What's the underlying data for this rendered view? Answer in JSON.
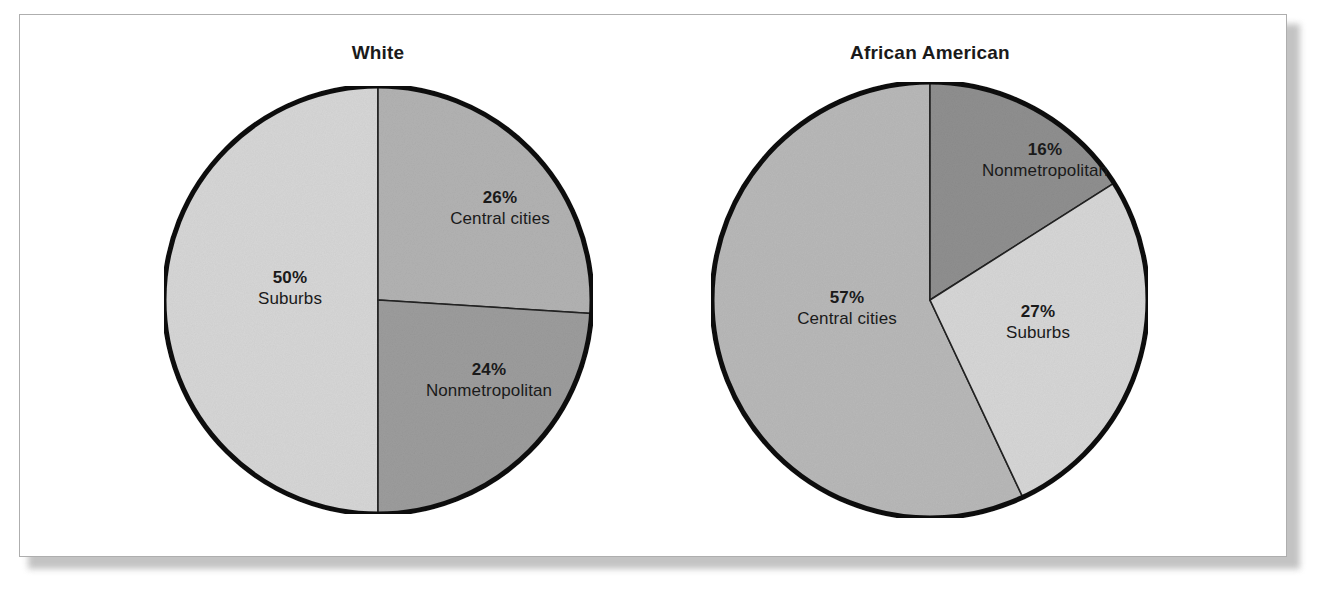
{
  "figure": {
    "background_color": "#ffffff",
    "frame_border_color": "#aeaeae"
  },
  "chart_data": [
    {
      "type": "pie",
      "title": "White",
      "categories": [
        "Central cities",
        "Nonmetropolitan",
        "Suburbs"
      ],
      "values": [
        26,
        24,
        50
      ],
      "labels": [
        "26%",
        "24%",
        "50%"
      ],
      "unit": "percent",
      "legend": "none",
      "slice_colors": [
        "#b2b2b2",
        "#9c9c9c",
        "#d6d6d6"
      ],
      "slices": [
        {
          "label": "Central cities",
          "value": 26,
          "value_label": "26%",
          "color": "#b2b2b2",
          "start_deg": 0,
          "end_deg": 93.6
        },
        {
          "label": "Nonmetropolitan",
          "value": 24,
          "value_label": "24%",
          "color": "#9c9c9c",
          "start_deg": 93.6,
          "end_deg": 180
        },
        {
          "label": "Suburbs",
          "value": 50,
          "value_label": "50%",
          "color": "#d6d6d6",
          "start_deg": 180,
          "end_deg": 360
        }
      ]
    },
    {
      "type": "pie",
      "title": "African American",
      "categories": [
        "Nonmetropolitan",
        "Suburbs",
        "Central cities"
      ],
      "values": [
        16,
        27,
        57
      ],
      "labels": [
        "16%",
        "27%",
        "57%"
      ],
      "unit": "percent",
      "legend": "none",
      "slice_colors": [
        "#8f8f8f",
        "#d6d6d6",
        "#b8b8b8"
      ],
      "slices": [
        {
          "label": "Nonmetropolitan",
          "value": 16,
          "value_label": "16%",
          "color": "#8f8f8f",
          "start_deg": 0,
          "end_deg": 57.6
        },
        {
          "label": "Suburbs",
          "value": 27,
          "value_label": "27%",
          "color": "#d6d6d6",
          "start_deg": 57.6,
          "end_deg": 154.8
        },
        {
          "label": "Central cities",
          "value": 57,
          "value_label": "57%",
          "color": "#b8b8b8",
          "start_deg": 154.8,
          "end_deg": 360
        }
      ]
    }
  ],
  "pies": {
    "white": {
      "title": "White",
      "central_cities": {
        "pct": "26%",
        "name": "Central cities"
      },
      "nonmetropolitan": {
        "pct": "24%",
        "name": "Nonmetropolitan"
      },
      "suburbs": {
        "pct": "50%",
        "name": "Suburbs"
      }
    },
    "african_american": {
      "title": "African American",
      "nonmetropolitan": {
        "pct": "16%",
        "name": "Nonmetropolitan"
      },
      "suburbs": {
        "pct": "27%",
        "name": "Suburbs"
      },
      "central_cities": {
        "pct": "57%",
        "name": "Central cities"
      }
    }
  }
}
